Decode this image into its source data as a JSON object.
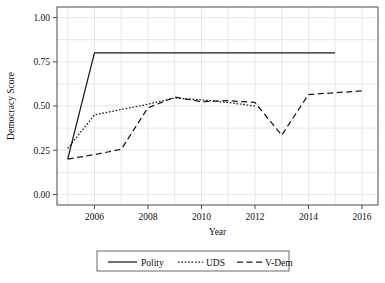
{
  "chart_data": {
    "type": "line",
    "title": "",
    "xlabel": "Year",
    "ylabel": "Democracy Score",
    "xlim": [
      2004.6,
      2016.6
    ],
    "ylim": [
      -0.06,
      1.06
    ],
    "grid": true,
    "legend_position": "bottom",
    "xticks": [
      2006,
      2008,
      2010,
      2012,
      2014,
      2016
    ],
    "xtick_labels": [
      "2006",
      "2008",
      "2010",
      "2012",
      "2014",
      "2016"
    ],
    "yticks": [
      0.0,
      0.25,
      0.5,
      0.75,
      1.0
    ],
    "ytick_labels": [
      "0.00",
      "0.25",
      "0.50",
      "0.75",
      "1.00"
    ],
    "series": [
      {
        "name": "Polity",
        "style": "solid",
        "x": [
          2005,
          2006,
          2007,
          2008,
          2009,
          2010,
          2011,
          2012,
          2013,
          2014,
          2015
        ],
        "values": [
          0.2,
          0.8,
          0.8,
          0.8,
          0.8,
          0.8,
          0.8,
          0.8,
          0.8,
          0.8,
          0.8
        ]
      },
      {
        "name": "UDS",
        "style": "dotted",
        "x": [
          2005,
          2006,
          2007,
          2008,
          2009,
          2010,
          2011,
          2012
        ],
        "values": [
          0.26,
          0.45,
          0.48,
          0.51,
          0.545,
          0.535,
          0.52,
          0.5
        ]
      },
      {
        "name": "V-Dem",
        "style": "dashed",
        "x": [
          2005,
          2006,
          2007,
          2008,
          2009,
          2010,
          2011,
          2012,
          2013,
          2014,
          2015,
          2016
        ],
        "values": [
          0.2,
          0.225,
          0.255,
          0.49,
          0.55,
          0.525,
          0.53,
          0.52,
          0.335,
          0.565,
          0.575,
          0.585
        ]
      }
    ]
  },
  "legend": {
    "entries": [
      {
        "label": "Polity",
        "style": "solid"
      },
      {
        "label": "UDS",
        "style": "dotted"
      },
      {
        "label": "V-Dem",
        "style": "dashed"
      }
    ]
  }
}
